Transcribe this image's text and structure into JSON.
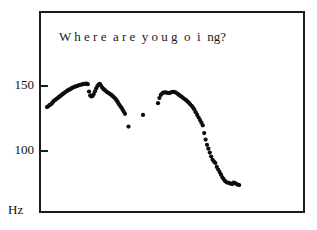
{
  "figure": {
    "unit_label": "Hz",
    "title": "W h e r e  a r e  y o u g  o  i  ng?"
  },
  "axes": {
    "y_ticks": [
      {
        "label": "150",
        "value": 150
      },
      {
        "label": "100",
        "value": 100
      }
    ]
  },
  "chart_data": {
    "type": "scatter",
    "xlabel": "",
    "ylabel": "Hz",
    "ylim": [
      60,
      165
    ],
    "xlim": [
      0,
      100
    ],
    "grid": false,
    "legend": null,
    "marker": "filled-circle",
    "color": "#0d0d0d",
    "axis_color": "#1a1a1a",
    "background": "#ffffff",
    "y_tick_values": [
      150,
      100
    ],
    "annotation": "F0 pitch contour of the spoken utterance 'Where are you going?'",
    "series": [
      {
        "name": "voiced-segment-1",
        "x": [
          8.0,
          9.2,
          10.4,
          11.6,
          12.8,
          14.0,
          15.2,
          16.4,
          17.6,
          18.8,
          20.0,
          21.2,
          22.4,
          23.6,
          24.8,
          26.0,
          27.2,
          28.4,
          29.6,
          30.8,
          32.0,
          33.2,
          34.4,
          35.6,
          36.8,
          38.0,
          39.2,
          40.4,
          41.6,
          42.8,
          44.0,
          45.2,
          46.4,
          47.6,
          48.8,
          50.0,
          51.2,
          52.4,
          53.6,
          54.8,
          56.0,
          57.2,
          58.4,
          59.6,
          60.8,
          62.0,
          63.2,
          64.4,
          65.6,
          66.8,
          68.0,
          69.2,
          70.4,
          71.6,
          72.8,
          74.0,
          75.2,
          76.4,
          77.6,
          78.8,
          80.0,
          81.2,
          82.4,
          83.6,
          84.8,
          86.0
        ],
        "y": [
          133.0,
          133.6,
          134.5,
          135.0,
          135.8,
          137.0,
          138.0,
          138.6,
          139.4,
          140.0,
          140.8,
          141.5,
          142.2,
          143.0,
          143.6,
          144.4,
          145.0,
          145.6,
          146.2,
          146.6,
          147.2,
          147.8,
          148.2,
          148.6,
          149.0,
          149.2,
          149.6,
          150.0,
          150.2,
          150.4,
          150.6,
          150.8,
          150.9,
          151.0,
          150.6,
          145.0,
          142.0,
          141.2,
          141.6,
          143.0,
          145.2,
          147.4,
          149.2,
          150.4,
          150.8,
          149.6,
          148.0,
          147.0,
          146.2,
          145.4,
          144.6,
          144.0,
          143.4,
          142.8,
          142.0,
          141.2,
          140.4,
          139.4,
          138.2,
          136.8,
          135.2,
          133.8,
          132.6,
          131.0,
          129.4,
          127.8
        ]
      },
      {
        "name": "voiced-segment-1-tail",
        "x": [
          89.5
        ],
        "y": [
          118.0
        ]
      },
      {
        "name": "isolated-point",
        "x": [
          104.0
        ],
        "y": [
          127.0
        ]
      },
      {
        "name": "voiced-segment-2",
        "x": [
          119.0,
          120.4,
          121.8,
          123.2,
          124.6,
          126.0,
          127.4,
          128.8,
          130.2,
          131.6,
          133.0,
          134.4,
          135.8,
          137.2,
          138.6,
          140.0,
          141.4,
          142.8,
          144.2,
          145.6,
          147.0,
          148.4,
          149.8,
          151.2,
          152.6,
          154.0,
          155.4,
          156.8,
          158.2,
          159.6,
          161.0,
          162.4,
          163.8,
          165.2,
          166.6,
          168.0,
          169.4,
          170.8,
          172.2,
          173.6,
          175.0,
          176.4,
          177.8,
          179.2,
          180.6,
          182.0,
          183.4,
          184.8,
          186.2,
          187.6,
          189.0,
          190.4,
          191.8,
          193.2,
          194.6,
          196.0,
          197.4,
          198.8,
          200.2
        ],
        "y": [
          136.0,
          140.0,
          142.4,
          143.6,
          144.2,
          144.4,
          144.2,
          144.0,
          143.8,
          144.2,
          144.6,
          144.8,
          144.6,
          144.0,
          143.2,
          142.4,
          141.6,
          140.8,
          140.0,
          139.2,
          138.4,
          137.4,
          136.4,
          135.2,
          134.0,
          132.6,
          131.0,
          129.0,
          127.0,
          125.0,
          123.0,
          121.0,
          119.0,
          113.0,
          108.0,
          104.0,
          101.0,
          98.0,
          95.0,
          92.5,
          91.0,
          90.0,
          87.0,
          85.0,
          83.0,
          81.0,
          79.0,
          77.5,
          76.0,
          75.2,
          74.8,
          74.5,
          74.2,
          73.8,
          75.0,
          74.6,
          73.8,
          73.4,
          73.0
        ]
      }
    ]
  }
}
